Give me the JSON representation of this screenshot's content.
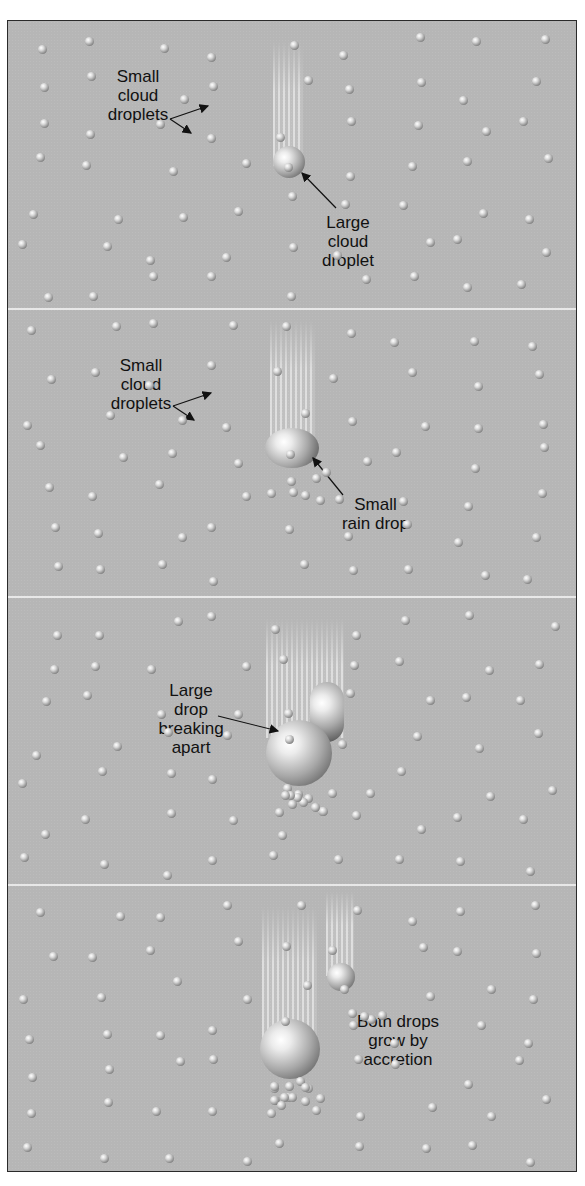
{
  "figure": {
    "background_color": "#b6b6b6",
    "border_color": "#2a2a2a",
    "divider_color": "#f1f1f1",
    "panels": [
      {
        "id": "panel-1",
        "labels": [
          {
            "text_lines": [
              "Small",
              "cloud",
              "droplets"
            ]
          },
          {
            "text_lines": [
              "Large",
              "cloud",
              "droplet"
            ]
          }
        ]
      },
      {
        "id": "panel-2",
        "labels": [
          {
            "text_lines": [
              "Small",
              "cloud",
              "droplets"
            ]
          },
          {
            "text_lines": [
              "Small",
              "rain drop"
            ]
          }
        ]
      },
      {
        "id": "panel-3",
        "labels": [
          {
            "text_lines": [
              "Large",
              "drop",
              "breaking",
              "apart"
            ]
          }
        ]
      },
      {
        "id": "panel-4",
        "labels": [
          {
            "text_lines": [
              "Both drops",
              "grow by",
              "accretion"
            ]
          }
        ]
      }
    ]
  }
}
